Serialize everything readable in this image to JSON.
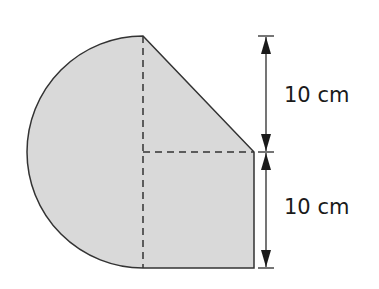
{
  "figure": {
    "type": "composite-shape",
    "fill_color": "#d9d9d9",
    "stroke_color": "#333333",
    "dimensions": [
      {
        "label": "10 cm",
        "position": "upper"
      },
      {
        "label": "10 cm",
        "position": "lower"
      }
    ]
  }
}
